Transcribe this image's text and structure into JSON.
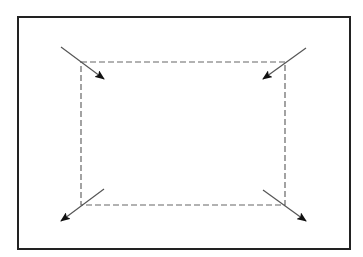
{
  "diagram": {
    "colors": {
      "background": "#ffffff",
      "outer_border": "#222222",
      "dashed_border": "#666666",
      "arrow_line": "#555555",
      "arrow_head": "#111111"
    },
    "outer_rect": {
      "x": 18,
      "y": 17,
      "width": 332,
      "height": 232,
      "stroke_width": 2
    },
    "dashed_rect": {
      "x": 81,
      "y": 62,
      "width": 204,
      "height": 143,
      "stroke_width": 1.2,
      "dash": "6 3"
    },
    "arrows": [
      {
        "name": "top-left",
        "x1": 61,
        "y1": 47,
        "x2": 104,
        "y2": 79
      },
      {
        "name": "top-right",
        "x1": 306,
        "y1": 48,
        "x2": 263,
        "y2": 79
      },
      {
        "name": "bottom-left",
        "x1": 104,
        "y1": 189,
        "x2": 61,
        "y2": 221
      },
      {
        "name": "bottom-right",
        "x1": 263,
        "y1": 190,
        "x2": 306,
        "y2": 221
      }
    ]
  }
}
